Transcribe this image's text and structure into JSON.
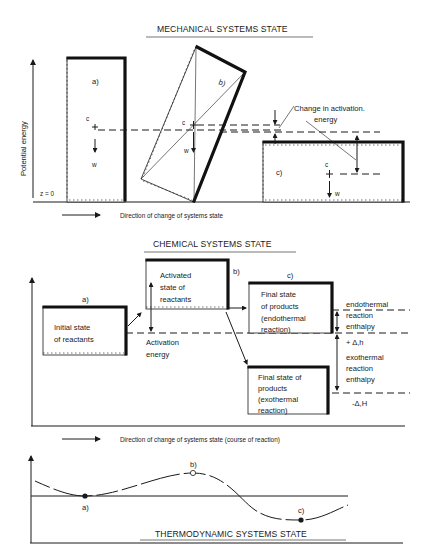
{
  "mechanical": {
    "title": "MECHANICAL SYSTEMS STATE",
    "y_axis_label": "Potential energy",
    "zero_label": "z = 0",
    "states": [
      {
        "id": "a",
        "label": "a)",
        "center_label": "c",
        "weight_label": "w"
      },
      {
        "id": "b",
        "label": "b)",
        "center_label": "c",
        "weight_label": "w"
      },
      {
        "id": "c",
        "label": "c)",
        "center_label": "c",
        "weight_label": "w"
      }
    ],
    "annotation_line1": "Change in activation.",
    "annotation_line2": "energy",
    "direction_label": "Direction of change of systems state"
  },
  "chemical": {
    "title": "CHEMICAL SYSTEMS STATE",
    "states": [
      {
        "id": "a",
        "label": "a)",
        "lines": [
          "Initial state",
          "of reactants"
        ]
      },
      {
        "id": "b",
        "label": "b)",
        "lines": [
          "Activated",
          "state of",
          "reactants"
        ]
      },
      {
        "id": "c_endo",
        "label": "c)",
        "lines": [
          "Final state",
          "of products",
          "(endothermal",
          "reaction)"
        ]
      },
      {
        "id": "c_exo",
        "label": "",
        "lines": [
          "Final state of",
          "products",
          "(exothermal",
          "reaction)"
        ]
      }
    ],
    "activation_label": [
      "Activation",
      "energy"
    ],
    "endothermal_label": [
      "endothermal",
      "reaction",
      "enthalpy"
    ],
    "endo_delta": "+ Δ,h",
    "exothermal_label": [
      "exothermal",
      "reaction",
      "enthalpy"
    ],
    "exo_delta": "-Δ,H",
    "direction_label": "Direction of change of systems state (course of reaction)"
  },
  "thermodynamic": {
    "title": "THERMODYNAMIC SYSTEMS STATE",
    "points": [
      {
        "id": "a",
        "label": "a)",
        "type": "filled"
      },
      {
        "id": "b",
        "label": "b)",
        "type": "open"
      },
      {
        "id": "c",
        "label": "c)",
        "type": "filled"
      }
    ]
  }
}
